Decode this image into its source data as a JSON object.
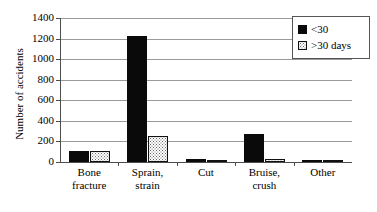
{
  "chart_data": {
    "type": "bar",
    "title": "",
    "xlabel": "",
    "ylabel": "Number of accidents",
    "categories": [
      "Bone fracture",
      "Sprain, strain",
      "Cut",
      "Bruise, crush",
      "Other"
    ],
    "category_lines": [
      [
        "Bone",
        "fracture"
      ],
      [
        "Sprain,",
        "strain"
      ],
      [
        "Cut",
        ""
      ],
      [
        "Bruise,",
        "crush"
      ],
      [
        "Other",
        ""
      ]
    ],
    "series": [
      {
        "name": "<30",
        "values": [
          105,
          1230,
          25,
          270,
          12
        ],
        "color": "#0a0a0a",
        "fill": "solid"
      },
      {
        "name": ">30 days",
        "values": [
          105,
          250,
          5,
          30,
          3
        ],
        "color": "#ffffff",
        "fill": "dotted"
      }
    ],
    "ylim": [
      0,
      1400
    ],
    "ytick_labels": [
      "1400",
      "1200",
      "1000",
      "800",
      "600",
      "400",
      "200",
      "0"
    ],
    "ytick_values": [
      1400,
      1200,
      1000,
      800,
      600,
      400,
      200,
      0
    ],
    "grid": "horizontal",
    "legend_position": "top-right",
    "legend_entries": [
      "<30",
      ">30 days"
    ]
  }
}
